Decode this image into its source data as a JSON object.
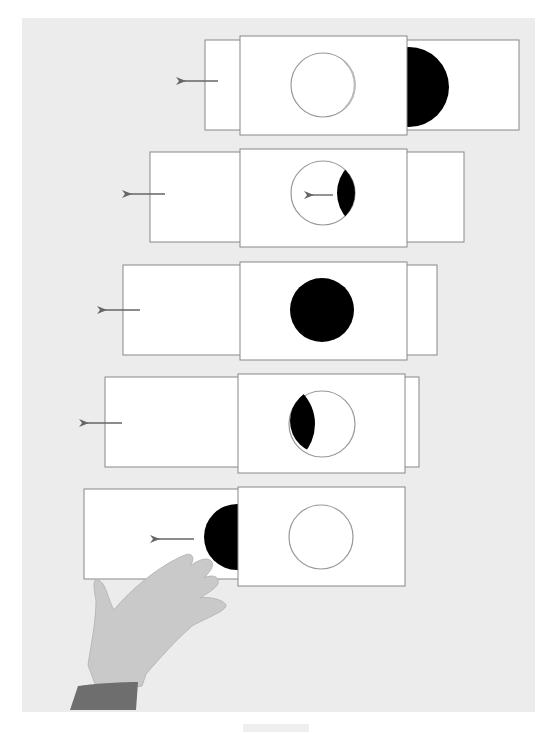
{
  "diagram": {
    "title": "",
    "colors": {
      "background": "#ececec",
      "card_fill": "#ffffff",
      "card_border": "#888888",
      "disc": "#000000",
      "arrow": "#666666",
      "hand_skin": "#c9c9c9",
      "sleeve": "#6e6e6e"
    },
    "stages": [
      {
        "index": 1,
        "disc_visible_in_window": "none",
        "disc_position": "right of window, outside",
        "arrow": "left"
      },
      {
        "index": 2,
        "disc_visible_in_window": "crescent on right",
        "disc_position": "entering window from right",
        "arrow": "left",
        "inner_arrow": "left"
      },
      {
        "index": 3,
        "disc_visible_in_window": "full disc",
        "disc_position": "centered in window",
        "arrow": "left"
      },
      {
        "index": 4,
        "disc_visible_in_window": "crescent on left",
        "disc_position": "leaving window to left",
        "arrow": "left"
      },
      {
        "index": 5,
        "disc_visible_in_window": "none",
        "disc_position": "left of window, outside",
        "arrow": "left",
        "hand": "pulling slider left"
      }
    ]
  }
}
